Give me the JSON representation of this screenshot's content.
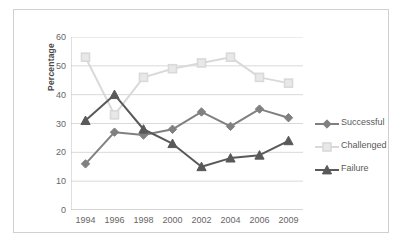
{
  "chart_data": {
    "type": "line",
    "title": "",
    "xlabel": "",
    "ylabel": "Percentage",
    "categories": [
      "1994",
      "1996",
      "1998",
      "2000",
      "2002",
      "2004",
      "2006",
      "2009"
    ],
    "series": [
      {
        "name": "Successful",
        "color": "#808080",
        "marker": "diamond",
        "values": [
          16,
          27,
          26,
          28,
          34,
          29,
          35,
          32
        ]
      },
      {
        "name": "Challenged",
        "color": "#d9d9d9",
        "marker": "square",
        "values": [
          53,
          33,
          46,
          49,
          51,
          53,
          46,
          44
        ]
      },
      {
        "name": "Failure",
        "color": "#595959",
        "marker": "triangle",
        "values": [
          31,
          40,
          28,
          23,
          15,
          18,
          19,
          24
        ]
      }
    ],
    "ylim": [
      0,
      60
    ],
    "ytick_labels": [
      "60",
      "50",
      "40",
      "30",
      "20",
      "10",
      "0"
    ],
    "yticks": [
      60,
      50,
      40,
      30,
      20,
      10,
      0
    ],
    "grid": "horizontal",
    "legend_position": "right",
    "legend_entries": [
      "Successful",
      "Challenged",
      "Failure"
    ],
    "axis_color": "#bfbfbf",
    "gridline_color": "#d9d9d9",
    "text_color": "#666666",
    "frame_color": "#d0d0d0",
    "background": "#ffffff"
  }
}
